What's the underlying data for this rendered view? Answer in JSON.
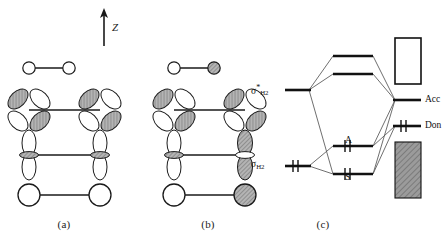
{
  "figure": {
    "axis": {
      "label": "Z",
      "name": "z-axis-arrow"
    },
    "captions": {
      "a": "(a)",
      "b": "(b)",
      "c": "(c)"
    }
  },
  "panel_a": {
    "caption": "(a)",
    "rows": [
      {
        "name": "h2-sigma-bonding",
        "type": "two-circles-bond",
        "left_fill": "white",
        "right_fill": "white",
        "size": "small"
      },
      {
        "name": "metal-d-orbital-pair",
        "type": "d-orbital-bond",
        "left_shaded_lobes": "upper-left,lower-right",
        "right_shaded_lobes": "upper-left,lower-right"
      },
      {
        "name": "metal-p-orbital-pair",
        "type": "p-orbital-vertical-bond",
        "left_shaded_lobes": "none",
        "right_shaded_lobes": "none"
      },
      {
        "name": "metal-s-orbital-pair",
        "type": "two-circles-bond",
        "left_fill": "white",
        "right_fill": "white",
        "size": "large"
      }
    ]
  },
  "panel_b": {
    "caption": "(b)",
    "rows": [
      {
        "name": "h2-sigma-antibonding",
        "type": "two-circles-bond",
        "left_fill": "white",
        "right_fill": "shaded",
        "size": "small"
      },
      {
        "name": "metal-d-orbital-pair",
        "type": "d-orbital-bond",
        "left_shaded_lobes": "upper-left,lower-right",
        "right_shaded_lobes": "upper-left,lower-right"
      },
      {
        "name": "metal-p-orbital-pair",
        "type": "p-orbital-vertical-bond",
        "left_shaded_lobes": "none",
        "right_shaded_lobes": "both"
      },
      {
        "name": "metal-s-orbital-pair",
        "type": "two-circles-bond",
        "left_fill": "white",
        "right_fill": "shaded",
        "size": "large"
      }
    ]
  },
  "panel_c": {
    "caption": "(c)",
    "left_levels": [
      {
        "name": "sigma-h2-antibonding-level",
        "label_sigma": "σ",
        "label_star": "*",
        "label_sub": "H",
        "label_sub2": "2",
        "electrons": "empty"
      },
      {
        "name": "sigma-h2-bonding-level",
        "label_sigma": "σ",
        "label_star": "",
        "label_sub": "H",
        "label_sub2": "2",
        "electrons": "paired"
      }
    ],
    "center_levels": [
      {
        "name": "upper-empty-level-1",
        "label": "",
        "electrons": "empty"
      },
      {
        "name": "upper-empty-level-2",
        "label": "",
        "electrons": "empty"
      },
      {
        "name": "level-a-antisymmetric",
        "label": "A",
        "electrons": "paired"
      },
      {
        "name": "level-s-symmetric",
        "label": "S",
        "electrons": "paired"
      }
    ],
    "right_levels": [
      {
        "name": "acceptor-level",
        "label": "Acc",
        "electrons": "empty"
      },
      {
        "name": "donor-level",
        "label": "Don",
        "electrons": "paired"
      }
    ],
    "bands": [
      {
        "name": "conduction-band-empty",
        "label": "",
        "fill": "empty"
      },
      {
        "name": "valence-band-filled",
        "label": "",
        "fill": "filled"
      }
    ]
  },
  "colors": {
    "ink": "#1a1a1a",
    "line": "#333333",
    "lobe_shade": "#9a9a9a",
    "band_fill": "#8f8f8f",
    "circle_shade": "#9d9d9d"
  }
}
